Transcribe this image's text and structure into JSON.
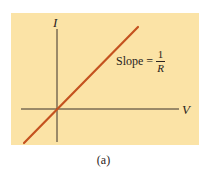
{
  "diagram": {
    "y_axis_label": "I",
    "x_axis_label": "V",
    "slope_label": {
      "prefix": "Slope =",
      "numerator": "1",
      "denominator": "R"
    },
    "caption": "(a)",
    "colors": {
      "background_panel": "#fbe3a6",
      "line": "#c4521f",
      "axes": "#3a302a"
    }
  }
}
